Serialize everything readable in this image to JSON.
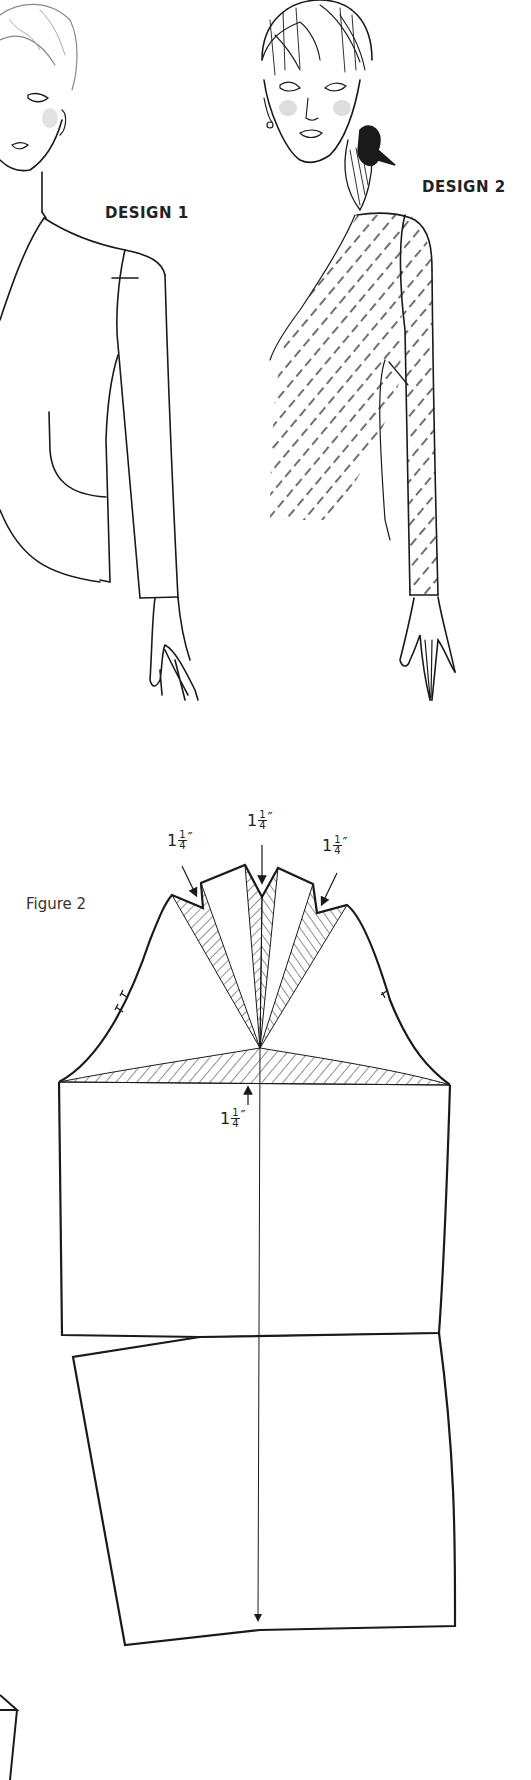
{
  "illustrations": {
    "design_1": {
      "label": "DESIGN 1"
    },
    "design_2": {
      "label": "DESIGN 2"
    }
  },
  "figure": {
    "label": "Figure 2",
    "measurements": [
      {
        "id": "left-dart",
        "whole": "1",
        "numerator": "1",
        "denominator": "4",
        "unit": "″"
      },
      {
        "id": "center-dart",
        "whole": "1",
        "numerator": "1",
        "denominator": "4",
        "unit": "″"
      },
      {
        "id": "right-dart",
        "whole": "1",
        "numerator": "1",
        "denominator": "4",
        "unit": "″"
      },
      {
        "id": "cap-height",
        "whole": "1",
        "numerator": "1",
        "denominator": "4",
        "unit": "″"
      }
    ]
  },
  "colors": {
    "ink": "#1a1a1a",
    "paper": "#ffffff",
    "blush": "#bdbdbd"
  }
}
